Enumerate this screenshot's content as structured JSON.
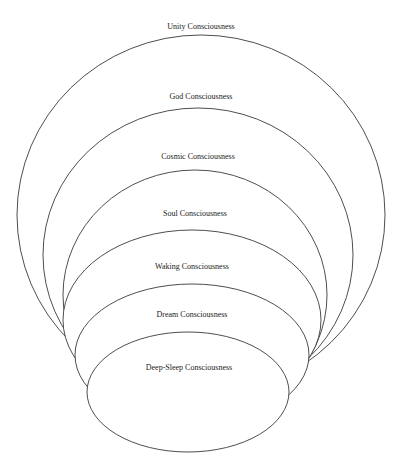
{
  "diagram": {
    "type": "nested-ellipses",
    "stroke_color": "#3a3a3a",
    "background_color": "#ffffff",
    "levels": [
      {
        "label": "Unity Consciousness"
      },
      {
        "label": "God Consciousness"
      },
      {
        "label": "Cosmic Consciousness"
      },
      {
        "label": "Soul Consciousness"
      },
      {
        "label": "Waking Consciousness"
      },
      {
        "label": "Dream Consciousness"
      },
      {
        "label": "Deep-Sleep Consciousness"
      }
    ]
  }
}
